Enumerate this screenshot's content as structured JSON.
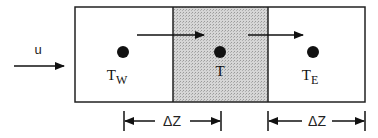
{
  "diagram": {
    "inflow_label": "u",
    "cells": [
      {
        "id": "west",
        "label_main": "T",
        "label_sub": "W",
        "shaded": false
      },
      {
        "id": "center",
        "label_main": "T",
        "label_sub": "",
        "shaded": true
      },
      {
        "id": "east",
        "label_main": "T",
        "label_sub": "E",
        "shaded": false
      }
    ],
    "dimensions": [
      {
        "label": "ΔZ",
        "from": "west-center",
        "to": "center-east-boundary"
      },
      {
        "label": "ΔZ",
        "from": "center-east-boundary",
        "to": "east-edge"
      }
    ],
    "colors": {
      "line": "#222222",
      "shade": "#c8c8c8"
    }
  }
}
